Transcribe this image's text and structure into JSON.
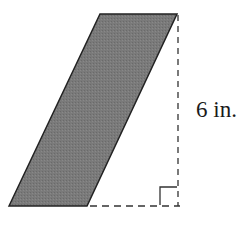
{
  "diagram": {
    "shape": "parallelogram",
    "fill_color": "#777777",
    "stroke_color": "#222222",
    "vertices": {
      "bottom_left": [
        9,
        206
      ],
      "top_left": [
        100,
        14
      ],
      "top_right": [
        177,
        14
      ],
      "bottom_right": [
        87,
        206
      ]
    },
    "height_line": {
      "style": "dashed",
      "from": [
        178,
        14
      ],
      "to": [
        178,
        206
      ]
    },
    "base_extension": {
      "style": "dashed",
      "from": [
        87,
        206
      ],
      "to": [
        180,
        206
      ]
    },
    "right_angle_marker": true,
    "height_label": "6 in."
  }
}
